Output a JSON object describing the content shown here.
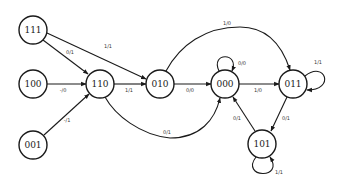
{
  "diagram": {
    "type": "state-transition-diagram",
    "states": [
      {
        "id": "111",
        "label": "111",
        "cx": 33,
        "cy": 30
      },
      {
        "id": "100",
        "label": "100",
        "cx": 33,
        "cy": 84
      },
      {
        "id": "001",
        "label": "001",
        "cx": 33,
        "cy": 145
      },
      {
        "id": "110",
        "label": "110",
        "cx": 100,
        "cy": 84
      },
      {
        "id": "010",
        "label": "010",
        "cx": 160,
        "cy": 84
      },
      {
        "id": "000",
        "label": "000",
        "cx": 225,
        "cy": 84
      },
      {
        "id": "011",
        "label": "011",
        "cx": 293,
        "cy": 84
      },
      {
        "id": "101",
        "label": "101",
        "cx": 262,
        "cy": 144
      }
    ],
    "transitions": [
      {
        "from": "111",
        "to": "110",
        "label": "0/1"
      },
      {
        "from": "111",
        "to": "010",
        "label": "1/1"
      },
      {
        "from": "100",
        "to": "110",
        "label": "-/0"
      },
      {
        "from": "001",
        "to": "110",
        "label": "-/1"
      },
      {
        "from": "110",
        "to": "010",
        "label": "1/1"
      },
      {
        "from": "110",
        "to": "000",
        "label": "0/1"
      },
      {
        "from": "010",
        "to": "000",
        "label": "0/0"
      },
      {
        "from": "010",
        "to": "011",
        "label": "1/0"
      },
      {
        "from": "000",
        "to": "000",
        "label": "0/0"
      },
      {
        "from": "000",
        "to": "011",
        "label": "1/0"
      },
      {
        "from": "011",
        "to": "011",
        "label": "1/1"
      },
      {
        "from": "011",
        "to": "101",
        "label": "0/1"
      },
      {
        "from": "101",
        "to": "000",
        "label": "0/1"
      },
      {
        "from": "101",
        "to": "101",
        "label": "1/1"
      }
    ]
  }
}
